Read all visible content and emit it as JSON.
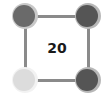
{
  "puzzle": {
    "center_value": "20",
    "edges": [
      {
        "name": "edge-top",
        "from": "top-left",
        "to": "top-right"
      },
      {
        "name": "edge-bottom",
        "from": "bottom-left",
        "to": "bottom-right"
      },
      {
        "name": "edge-left",
        "from": "top-left",
        "to": "bottom-left"
      },
      {
        "name": "edge-right",
        "from": "top-right",
        "to": "bottom-right"
      }
    ],
    "nodes": [
      {
        "position": "top-left",
        "icon": "moon-crescent-icon",
        "base_color": "#6a6a6a",
        "crescent_color": "#c8c8c8"
      },
      {
        "position": "top-right",
        "icon": "moon-crescent-icon",
        "base_color": "#555555",
        "crescent_color": "#b8b8b8"
      },
      {
        "position": "bottom-left",
        "icon": "moon-crescent-icon",
        "base_color": "#dcdcdc",
        "crescent_color": "#f2f2f2"
      },
      {
        "position": "bottom-right",
        "icon": "moon-crescent-icon",
        "base_color": "#555555",
        "crescent_color": "#b8b8b8"
      }
    ],
    "edge_color": "#8a8a8a"
  }
}
